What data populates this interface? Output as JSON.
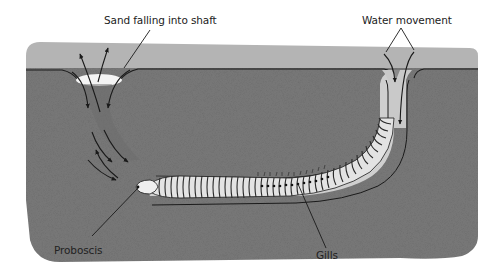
{
  "diagram": {
    "labels": {
      "sand_falling": "Sand falling into shaft",
      "water_movement": "Water movement",
      "proboscis": "Proboscis",
      "gills": "Gills"
    },
    "colors": {
      "sediment": "#7d7d7d",
      "sediment_dark": "#6f6f6f",
      "water_layer": "#b4b4b4",
      "burrow_lining": "#c9c9c9",
      "sand_pile": "#f4f4f4",
      "worm_body": "#e6e6e6",
      "line": "#1a1a1a",
      "background": "#ffffff"
    }
  }
}
